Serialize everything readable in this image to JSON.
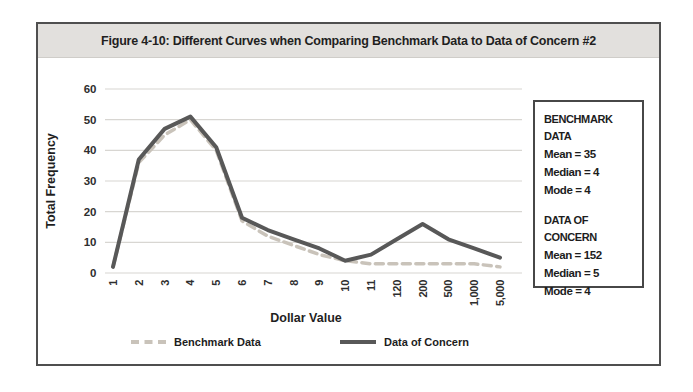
{
  "figure": {
    "title": "Figure 4-10: Different Curves when Comparing Benchmark Data to Data of Concern #2"
  },
  "chart_data": {
    "type": "line",
    "title": "Figure 4-10: Different Curves when Comparing Benchmark Data to Data of Concern #2",
    "xlabel": "Dollar Value",
    "ylabel": "Total Frequency",
    "categories": [
      "1",
      "2",
      "3",
      "4",
      "5",
      "6",
      "7",
      "8",
      "9",
      "10",
      "11",
      "120",
      "200",
      "500",
      "1,000",
      "5,000"
    ],
    "yticks": [
      0,
      10,
      20,
      30,
      40,
      50,
      60
    ],
    "ylim": [
      0,
      60
    ],
    "grid": true,
    "legend_position": "bottom",
    "series": [
      {
        "name": "Benchmark Data",
        "style": "dashed",
        "color": "#c9c3ba",
        "values": [
          2,
          36,
          45,
          50,
          40,
          17,
          12,
          9,
          6,
          4,
          3,
          3,
          3,
          3,
          3,
          2
        ]
      },
      {
        "name": "Data of Concern",
        "style": "solid",
        "color": "#585858",
        "values": [
          2,
          37,
          47,
          51,
          41,
          18,
          14,
          11,
          8,
          4,
          6,
          11,
          16,
          11,
          8,
          5
        ]
      }
    ]
  },
  "stats_box": {
    "sections": [
      {
        "heading_lines": [
          "BENCHMARK DATA"
        ],
        "stats": [
          "Mean = 35",
          "Median = 4",
          "Mode = 4"
        ]
      },
      {
        "heading_lines": [
          "DATA OF",
          "CONCERN"
        ],
        "stats": [
          "Mean = 152",
          "Median = 5",
          "Mode = 4"
        ]
      }
    ]
  },
  "colors": {
    "title_bar_bg": "#e2e0dd",
    "gridline": "#d8d6d2",
    "axis_text": "#2e2e2e",
    "benchmark_line": "#c9c3ba",
    "concern_line": "#585858"
  }
}
